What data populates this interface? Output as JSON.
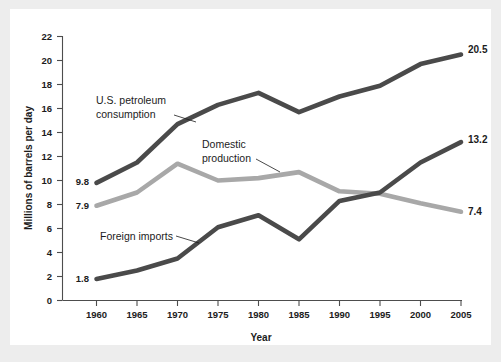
{
  "chart_data": {
    "type": "line",
    "title": "",
    "xlabel": "Year",
    "ylabel": "Millions of barrels per day",
    "x": [
      1960,
      1965,
      1970,
      1975,
      1980,
      1985,
      1990,
      1995,
      2000,
      2005
    ],
    "xtick_labels": [
      "1960",
      "1965",
      "1970",
      "1975",
      "1980",
      "1985",
      "1990",
      "1995",
      "2000",
      "2005"
    ],
    "ytick_labels": [
      "0",
      "2",
      "4",
      "6",
      "8",
      "10",
      "12",
      "14",
      "16",
      "18",
      "20",
      "22"
    ],
    "ytick_values": [
      0,
      2,
      4,
      6,
      8,
      10,
      12,
      14,
      16,
      18,
      20,
      22
    ],
    "xlim": [
      1960,
      2005
    ],
    "ylim": [
      0,
      22
    ],
    "grid": false,
    "legend_position": "inline-annotations",
    "series": [
      {
        "name": "U.S. petroleum consumption",
        "color": "#4a4a4a",
        "values": [
          9.8,
          11.5,
          14.7,
          16.3,
          17.3,
          15.7,
          17.0,
          17.9,
          19.7,
          20.5
        ],
        "start_label": "9.8",
        "end_label": "20.5"
      },
      {
        "name": "Domestic production",
        "color": "#a8a8a8",
        "values": [
          7.9,
          9.0,
          11.4,
          10.0,
          10.2,
          10.7,
          9.1,
          8.9,
          8.1,
          7.4
        ],
        "start_label": "7.9",
        "end_label": "7.4"
      },
      {
        "name": "Foreign imports",
        "color": "#4a4a4a",
        "values": [
          1.8,
          2.5,
          3.5,
          6.1,
          7.1,
          5.1,
          8.3,
          9.0,
          11.5,
          13.2
        ],
        "start_label": "1.8",
        "end_label": "13.2"
      }
    ],
    "annotations": [
      {
        "text_line1": "U.S. petroleum",
        "text_line2": "consumption"
      },
      {
        "text_line1": "Domestic",
        "text_line2": "production"
      },
      {
        "text_line1": "Foreign imports",
        "text_line2": ""
      }
    ]
  },
  "axes": {
    "y_title": "Millions of barrels per day",
    "x_title": "Year"
  },
  "labels": {
    "consumption_l1": "U.S. petroleum",
    "consumption_l2": "consumption",
    "domestic_l1": "Domestic",
    "domestic_l2": "production",
    "imports_l1": "Foreign imports",
    "start_consumption": "9.8",
    "start_domestic": "7.9",
    "start_imports": "1.8",
    "end_consumption": "20.5",
    "end_domestic": "13.2",
    "end_imports": "7.4"
  },
  "yticks": {
    "t0": "0",
    "t1": "2",
    "t2": "4",
    "t3": "6",
    "t4": "8",
    "t5": "10",
    "t6": "12",
    "t7": "14",
    "t8": "16",
    "t9": "18",
    "t10": "20",
    "t11": "22"
  },
  "xticks": {
    "t0": "1960",
    "t1": "1965",
    "t2": "1970",
    "t3": "1975",
    "t4": "1980",
    "t5": "1985",
    "t6": "1990",
    "t7": "1995",
    "t8": "2000",
    "t9": "2005"
  },
  "colors": {
    "dark_series": "#4a4a4a",
    "light_series": "#a8a8a8",
    "axis": "#4d4d4d",
    "panel_bg": "#ffffff",
    "page_bg": "#ededed"
  }
}
